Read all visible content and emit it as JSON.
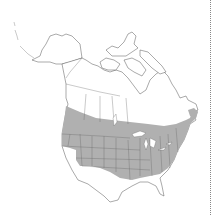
{
  "map": {
    "type": "range-map",
    "region": "North America",
    "range_fill_color": "#b0b0b0",
    "outline_color": "#555555",
    "background_color": "#ffffff",
    "range_description": "Shaded band across southern Canada and most of the contiguous United States, excluding the far southwest and Gulf coast"
  }
}
